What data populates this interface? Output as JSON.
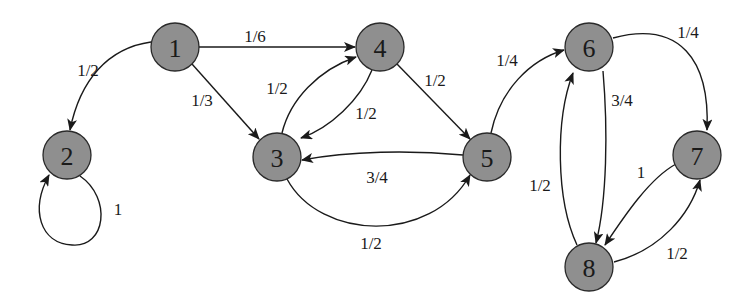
{
  "diagram": {
    "type": "markov-chain-state-diagram",
    "colors": {
      "node_fill": "#8f8f8f",
      "node_stroke": "#2a2a2a",
      "edge": "#1a1a1a",
      "background": "#ffffff"
    },
    "nodes": [
      {
        "id": "1",
        "label": "1"
      },
      {
        "id": "2",
        "label": "2"
      },
      {
        "id": "3",
        "label": "3"
      },
      {
        "id": "4",
        "label": "4"
      },
      {
        "id": "5",
        "label": "5"
      },
      {
        "id": "6",
        "label": "6"
      },
      {
        "id": "7",
        "label": "7"
      },
      {
        "id": "8",
        "label": "8"
      }
    ],
    "edges": [
      {
        "from": "1",
        "to": "2",
        "label": "1/2"
      },
      {
        "from": "1",
        "to": "4",
        "label": "1/6"
      },
      {
        "from": "1",
        "to": "3",
        "label": "1/3"
      },
      {
        "from": "2",
        "to": "2",
        "label": "1"
      },
      {
        "from": "3",
        "to": "4",
        "label": "1/2"
      },
      {
        "from": "4",
        "to": "3",
        "label": "1/2"
      },
      {
        "from": "4",
        "to": "5",
        "label": "1/2"
      },
      {
        "from": "5",
        "to": "3",
        "label": "3/4"
      },
      {
        "from": "3",
        "to": "5",
        "label": "1/2"
      },
      {
        "from": "5",
        "to": "6",
        "label": "1/4"
      },
      {
        "from": "6",
        "to": "7",
        "label": "1/4"
      },
      {
        "from": "6",
        "to": "8",
        "label": "3/4"
      },
      {
        "from": "8",
        "to": "6",
        "label": "1/2"
      },
      {
        "from": "7",
        "to": "8",
        "label": "1"
      },
      {
        "from": "8",
        "to": "7",
        "label": "1/2"
      }
    ]
  }
}
